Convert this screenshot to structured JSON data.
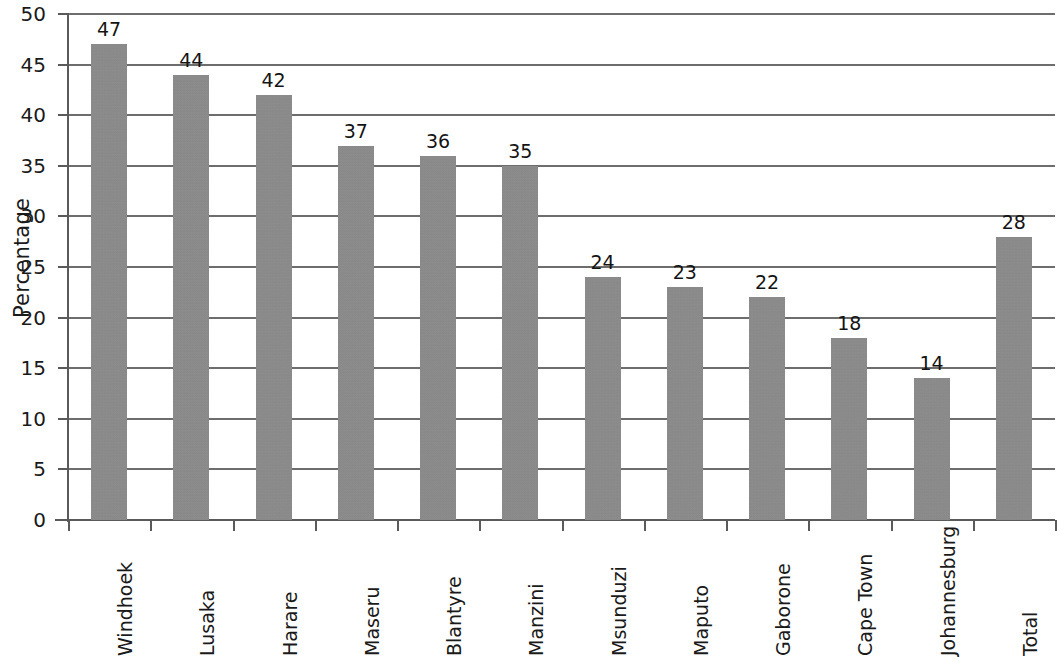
{
  "chart_data": {
    "type": "bar",
    "title": "",
    "xlabel": "",
    "ylabel": "Percentage",
    "ylim": [
      0,
      50
    ],
    "y_ticks": [
      0,
      5,
      10,
      15,
      20,
      25,
      30,
      35,
      40,
      45,
      50
    ],
    "grid": true,
    "legend": false,
    "bar_color": "#8c8c8c",
    "categories": [
      "Windhoek",
      "Lusaka",
      "Harare",
      "Maseru",
      "Blantyre",
      "Manzini",
      "Msunduzi",
      "Maputo",
      "Gaborone",
      "Cape Town",
      "Johannesburg",
      "Total"
    ],
    "values": [
      47,
      44,
      42,
      37,
      36,
      35,
      24,
      23,
      22,
      18,
      14,
      28
    ],
    "data_labels": [
      "47",
      "44",
      "42",
      "37",
      "36",
      "35",
      "24",
      "23",
      "22",
      "18",
      "14",
      "28"
    ],
    "y_tick_labels": [
      "0",
      "5",
      "10",
      "15",
      "20",
      "25",
      "30",
      "35",
      "40",
      "45",
      "50"
    ]
  }
}
